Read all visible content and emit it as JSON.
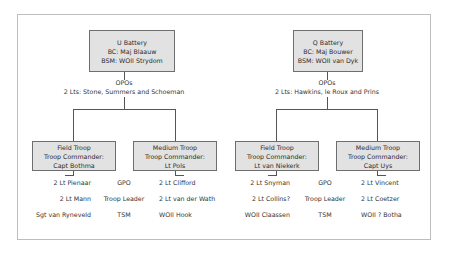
{
  "batteries": [
    {
      "id": "u",
      "lines": [
        "U Battery",
        "BC: Maj Blaauw",
        "BSM: WOII Strydom"
      ],
      "opos_label": "OPOs",
      "opos_detail": "2 Lts: Stone, Summers and Schoeman",
      "troops": [
        {
          "lines": [
            "Field Troop",
            "Troop Commander:",
            "Capt Bothma"
          ]
        },
        {
          "lines": [
            "Medium Troop",
            "Troop Commander:",
            "Lt Pols"
          ]
        }
      ],
      "rows": [
        {
          "left": "2 Lt Pienaar",
          "role": "GPO",
          "right": "2 Lt Clifford"
        },
        {
          "left": "2 Lt Mann",
          "role": "Troop Leader",
          "right": "2 Lt van der Wath"
        },
        {
          "left": "Sgt van Ryneveld",
          "role": "TSM",
          "right": "WOII Hook"
        }
      ]
    },
    {
      "id": "q",
      "lines": [
        "Q Battery",
        "BC: Maj Bouwer",
        "BSM: WOII van Dyk"
      ],
      "opos_label": "OPOs",
      "opos_detail": "2 Lts: Hawkins, le Roux and Prins",
      "troops": [
        {
          "lines": [
            "Field Troop",
            "Troop Commander:",
            "Lt van Niekerk"
          ]
        },
        {
          "lines": [
            "Medium Troop",
            "Troop Commander:",
            "Capt Uys"
          ]
        }
      ],
      "rows": [
        {
          "left": "2 Lt Snyman",
          "role": "GPO",
          "right": "2 Lt Vincent"
        },
        {
          "left": "2 Lt Collins?",
          "role": "Troop Leader",
          "right": "2 Lt Coetzer"
        },
        {
          "left": "WOII Claassen",
          "role": "TSM",
          "right": "WOII ? Botha"
        }
      ]
    }
  ],
  "colors": {
    "box_fill": "#e2e2e2",
    "box_border": "#6e6e6e",
    "line": "#555555",
    "frame": "#bdbdbd"
  }
}
